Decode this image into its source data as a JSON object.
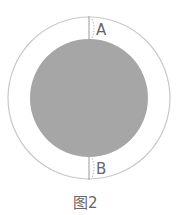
{
  "figure": {
    "caption": "图2",
    "labels": {
      "top": "A",
      "bottom": "B"
    },
    "colors": {
      "outer_ring_stroke": "#c8c8c8",
      "inner_disc_fill": "#a6a6a6",
      "segment_line": "#9a9a9a",
      "label_text": "#666666"
    },
    "geometry": {
      "outer_circle": {
        "cx": 89,
        "cy": 98,
        "r": 81
      },
      "inner_circle": {
        "cx": 89,
        "cy": 98,
        "r": 59
      }
    }
  }
}
